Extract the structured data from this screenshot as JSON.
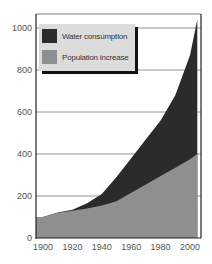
{
  "chart_data": {
    "type": "area",
    "stacked": true,
    "title": "",
    "xlabel": "",
    "ylabel": "",
    "x": [
      1900,
      1910,
      1920,
      1930,
      1940,
      1950,
      1960,
      1970,
      1980,
      1990,
      2000,
      2005
    ],
    "series": [
      {
        "name": "Population increase",
        "color": "#8f8f8f",
        "values": [
          100,
          120,
          130,
          140,
          155,
          175,
          215,
          255,
          295,
          335,
          375,
          400
        ]
      },
      {
        "name": "Water consumption",
        "color": "#2b2b2b",
        "values": [
          100,
          122,
          135,
          165,
          210,
          290,
          380,
          470,
          560,
          680,
          870,
          1040
        ]
      }
    ],
    "xticks": [
      "1900",
      "1920",
      "1940",
      "1960",
      "1980",
      "2000"
    ],
    "yticks": [
      "0",
      "200",
      "400",
      "600",
      "800",
      "1000"
    ],
    "xlim": [
      1898,
      2006
    ],
    "ylim": [
      0,
      1060
    ],
    "grid": "horizontal",
    "legend_position": "upper-left"
  },
  "legend": {
    "items": [
      {
        "label": "Water consumption",
        "color": "#2b2b2b"
      },
      {
        "label": "Population increase",
        "color": "#8f8f8f"
      }
    ]
  }
}
